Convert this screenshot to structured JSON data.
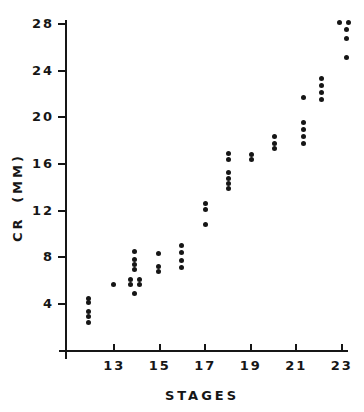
{
  "figure": {
    "background": "#ffffff",
    "ink": "#161616"
  },
  "chart_data": {
    "type": "scatter",
    "title": "",
    "xlabel": "STAGES",
    "ylabel": "CR (MM)",
    "x_ticks": [
      13,
      15,
      17,
      19,
      21,
      23
    ],
    "y_ticks": [
      4,
      8,
      12,
      16,
      20,
      24,
      28
    ],
    "xlim": [
      10.9,
      23.5
    ],
    "ylim": [
      0,
      28.5
    ],
    "grid": false,
    "legend": "none",
    "marker": "filled-black-circle",
    "points": [
      [
        11.85,
        4.5
      ],
      [
        11.85,
        4.1
      ],
      [
        11.85,
        3.4
      ],
      [
        11.85,
        2.9
      ],
      [
        11.85,
        2.4
      ],
      [
        12.95,
        5.7
      ],
      [
        13.9,
        8.5
      ],
      [
        13.9,
        7.8
      ],
      [
        13.9,
        7.4
      ],
      [
        13.9,
        7.0
      ],
      [
        13.7,
        6.1
      ],
      [
        14.1,
        6.1
      ],
      [
        13.7,
        5.7
      ],
      [
        14.1,
        5.7
      ],
      [
        13.9,
        4.9
      ],
      [
        14.95,
        8.3
      ],
      [
        14.95,
        7.2
      ],
      [
        14.95,
        6.8
      ],
      [
        15.95,
        9.0
      ],
      [
        15.95,
        8.4
      ],
      [
        15.95,
        7.7
      ],
      [
        15.95,
        7.1
      ],
      [
        17.0,
        12.6
      ],
      [
        17.0,
        12.1
      ],
      [
        17.0,
        10.8
      ],
      [
        18.0,
        16.9
      ],
      [
        18.0,
        16.4
      ],
      [
        18.0,
        15.3
      ],
      [
        18.0,
        14.8
      ],
      [
        18.0,
        14.35
      ],
      [
        18.0,
        13.9
      ],
      [
        19.05,
        16.8
      ],
      [
        19.05,
        16.35
      ],
      [
        20.05,
        18.4
      ],
      [
        20.05,
        17.8
      ],
      [
        20.05,
        17.35
      ],
      [
        21.3,
        21.7
      ],
      [
        21.3,
        19.6
      ],
      [
        21.3,
        19.0
      ],
      [
        21.3,
        18.35
      ],
      [
        21.3,
        17.75
      ],
      [
        22.1,
        23.3
      ],
      [
        22.1,
        22.7
      ],
      [
        22.1,
        22.1
      ],
      [
        22.1,
        21.5
      ],
      [
        22.9,
        28.1
      ],
      [
        23.3,
        28.1
      ],
      [
        23.2,
        27.5
      ],
      [
        23.2,
        26.8
      ],
      [
        23.2,
        25.1
      ]
    ]
  }
}
